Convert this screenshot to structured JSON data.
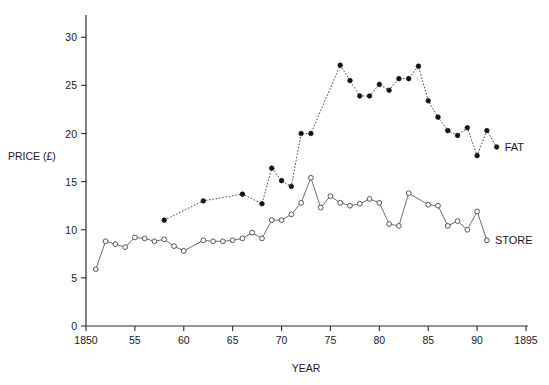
{
  "chart_data": {
    "type": "line",
    "title": "",
    "xlabel": "YEAR",
    "ylabel": "PRICE (£)",
    "xlim": [
      1850,
      1895
    ],
    "ylim": [
      0,
      32
    ],
    "grid": false,
    "legend_position": "right-inline",
    "x_ticks": [
      {
        "value": 1850,
        "label": "1850"
      },
      {
        "value": 1855,
        "label": "55"
      },
      {
        "value": 1860,
        "label": "60"
      },
      {
        "value": 1865,
        "label": "65"
      },
      {
        "value": 1870,
        "label": "70"
      },
      {
        "value": 1875,
        "label": "75"
      },
      {
        "value": 1880,
        "label": "80"
      },
      {
        "value": 1885,
        "label": "85"
      },
      {
        "value": 1890,
        "label": "90"
      },
      {
        "value": 1895,
        "label": "1895"
      }
    ],
    "y_ticks": [
      {
        "value": 0,
        "label": "0"
      },
      {
        "value": 5,
        "label": "5"
      },
      {
        "value": 10,
        "label": "10"
      },
      {
        "value": 15,
        "label": "15"
      },
      {
        "value": 20,
        "label": "20"
      },
      {
        "value": 25,
        "label": "25"
      },
      {
        "value": 30,
        "label": "30"
      }
    ],
    "series": [
      {
        "name": "FAT",
        "label": "FAT",
        "marker": "filled-circle",
        "linestyle": "dotted",
        "color": "#111111",
        "points": [
          {
            "x": 1858,
            "y": 11.0
          },
          {
            "x": 1862,
            "y": 13.0
          },
          {
            "x": 1866,
            "y": 13.7
          },
          {
            "x": 1868,
            "y": 12.7
          },
          {
            "x": 1869,
            "y": 16.4
          },
          {
            "x": 1870,
            "y": 15.1
          },
          {
            "x": 1871,
            "y": 14.5
          },
          {
            "x": 1872,
            "y": 20.0
          },
          {
            "x": 1873,
            "y": 20.0
          },
          {
            "x": 1876,
            "y": 27.1
          },
          {
            "x": 1877,
            "y": 25.5
          },
          {
            "x": 1878,
            "y": 23.9
          },
          {
            "x": 1879,
            "y": 23.9
          },
          {
            "x": 1880,
            "y": 25.1
          },
          {
            "x": 1881,
            "y": 24.5
          },
          {
            "x": 1882,
            "y": 25.7
          },
          {
            "x": 1883,
            "y": 25.7
          },
          {
            "x": 1884,
            "y": 27.0
          },
          {
            "x": 1885,
            "y": 23.4
          },
          {
            "x": 1886,
            "y": 21.7
          },
          {
            "x": 1887,
            "y": 20.3
          },
          {
            "x": 1888,
            "y": 19.8
          },
          {
            "x": 1889,
            "y": 20.6
          },
          {
            "x": 1890,
            "y": 17.7
          },
          {
            "x": 1891,
            "y": 20.3
          },
          {
            "x": 1892,
            "y": 18.6
          }
        ]
      },
      {
        "name": "STORE",
        "label": "STORE",
        "marker": "open-circle",
        "linestyle": "solid",
        "color": "#6e6e6e",
        "points": [
          {
            "x": 1851,
            "y": 5.9
          },
          {
            "x": 1852,
            "y": 8.8
          },
          {
            "x": 1853,
            "y": 8.5
          },
          {
            "x": 1854,
            "y": 8.2
          },
          {
            "x": 1855,
            "y": 9.2
          },
          {
            "x": 1856,
            "y": 9.1
          },
          {
            "x": 1857,
            "y": 8.8
          },
          {
            "x": 1858,
            "y": 9.0
          },
          {
            "x": 1859,
            "y": 8.3
          },
          {
            "x": 1860,
            "y": 7.8
          },
          {
            "x": 1862,
            "y": 8.9
          },
          {
            "x": 1863,
            "y": 8.8
          },
          {
            "x": 1864,
            "y": 8.8
          },
          {
            "x": 1865,
            "y": 8.9
          },
          {
            "x": 1866,
            "y": 9.1
          },
          {
            "x": 1867,
            "y": 9.7
          },
          {
            "x": 1868,
            "y": 9.1
          },
          {
            "x": 1869,
            "y": 11.0
          },
          {
            "x": 1870,
            "y": 11.0
          },
          {
            "x": 1871,
            "y": 11.6
          },
          {
            "x": 1872,
            "y": 12.8
          },
          {
            "x": 1873,
            "y": 15.4
          },
          {
            "x": 1874,
            "y": 12.3
          },
          {
            "x": 1875,
            "y": 13.5
          },
          {
            "x": 1876,
            "y": 12.8
          },
          {
            "x": 1877,
            "y": 12.5
          },
          {
            "x": 1878,
            "y": 12.7
          },
          {
            "x": 1879,
            "y": 13.2
          },
          {
            "x": 1880,
            "y": 12.8
          },
          {
            "x": 1881,
            "y": 10.6
          },
          {
            "x": 1882,
            "y": 10.4
          },
          {
            "x": 1883,
            "y": 13.8
          },
          {
            "x": 1885,
            "y": 12.6
          },
          {
            "x": 1886,
            "y": 12.5
          },
          {
            "x": 1887,
            "y": 10.4
          },
          {
            "x": 1888,
            "y": 10.9
          },
          {
            "x": 1889,
            "y": 10.0
          },
          {
            "x": 1890,
            "y": 11.9
          },
          {
            "x": 1891,
            "y": 8.9
          }
        ]
      }
    ]
  }
}
